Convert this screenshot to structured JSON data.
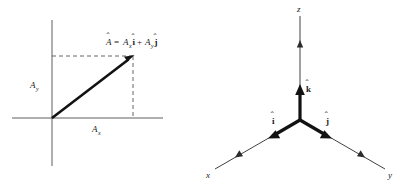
{
  "figure": {
    "background_color": "#ffffff",
    "line_color": "#121212",
    "axis_color": "#4d4d4d",
    "dash_color": "#555555"
  },
  "panel_2d": {
    "name": "vector-decomposition-diagram",
    "equation": {
      "vector_symbol": "A",
      "equals": "=",
      "term1_coefficient": "A",
      "term1_subscript": "x",
      "term1_unit_vector": "i",
      "plus": "+",
      "term2_coefficient": "A",
      "term2_subscript": "y",
      "term2_unit_vector": "j",
      "full_text": "A = Aₓî + Aᵧĵ"
    },
    "labels": {
      "y_component": "A",
      "y_component_sub": "y",
      "x_component": "A",
      "x_component_sub": "x"
    },
    "geometry": {
      "origin": [
        52,
        118
      ],
      "tip": [
        133,
        56
      ],
      "x_axis_range": [
        12,
        163
      ],
      "y_axis_range": [
        20,
        166
      ]
    }
  },
  "panel_3d": {
    "name": "cartesian-unit-vectors-diagram",
    "axis_labels": {
      "z": "z",
      "x": "x",
      "y": "y"
    },
    "unit_vectors": {
      "k": "k",
      "i": "i",
      "j": "j",
      "hat": "ˆ"
    },
    "geometry": {
      "origin": [
        100,
        120
      ],
      "z_tip": [
        100,
        18
      ],
      "x_tip": [
        13,
        170
      ],
      "y_tip": [
        187,
        170
      ]
    }
  }
}
